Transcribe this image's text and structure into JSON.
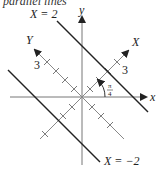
{
  "caption": "parallel lines",
  "axes": {
    "x_label": "x",
    "y_label": "y",
    "X_label": "X",
    "Y_label": "Y",
    "tick_label_X": "3",
    "tick_label_Y": "3"
  },
  "lines": {
    "upper": "X = 2",
    "lower": "X = −2"
  },
  "angle": {
    "numerator": "π",
    "denominator": "4"
  },
  "colors": {
    "axis": "#666666",
    "line": "#222222",
    "rotated_axis": "#777777"
  }
}
